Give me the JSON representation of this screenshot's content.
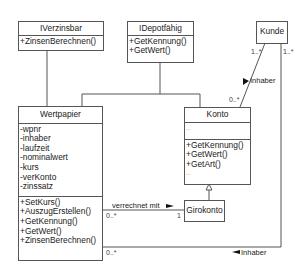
{
  "diagram": {
    "type": "uml-class-diagram",
    "classes": {
      "iverzinsbar": {
        "name": "IVerzinsbar",
        "methods": [
          "+ZinsenBerechnen()"
        ]
      },
      "idepotfaehig": {
        "name": "IDepotfähig",
        "methods": [
          "+GetKennung()",
          "+GetWert()"
        ]
      },
      "kunde": {
        "name": "Kunde"
      },
      "wertpapier": {
        "name": "Wertpapier",
        "attributes": [
          "-wpnr",
          "-inhaber",
          "-laufzeit",
          "-nominalwert",
          "-kurs",
          "-verKonto",
          "-zinssatz"
        ],
        "methods": [
          "+SetKurs()",
          "+AuszugErstellen()",
          "+GetKennung()",
          "+GetWert()",
          "+ZinsenBerechnen()"
        ]
      },
      "konto": {
        "name": "Konto",
        "attributes": [
          "..."
        ],
        "methods": [
          "+GetKennung()",
          "+GetWert()",
          "+GetArt()",
          "..."
        ]
      },
      "girokonto": {
        "name": "Girokonto"
      }
    },
    "associations": {
      "kunde_konto": {
        "label": "Inhaber",
        "mult_kunde": "1..*",
        "mult_konto": "0..*"
      },
      "wertpapier_girokonto": {
        "label": "verrechnet mit",
        "mult_wertpapier": "0..*",
        "mult_girokonto": "1"
      },
      "kunde_wertpapier": {
        "label": "Inhaber",
        "mult_kunde": "1..*",
        "mult_wertpapier": "0..*"
      }
    },
    "colors": {
      "line": "#555555",
      "text": "#1a1a1a",
      "background": "#ffffff"
    }
  }
}
